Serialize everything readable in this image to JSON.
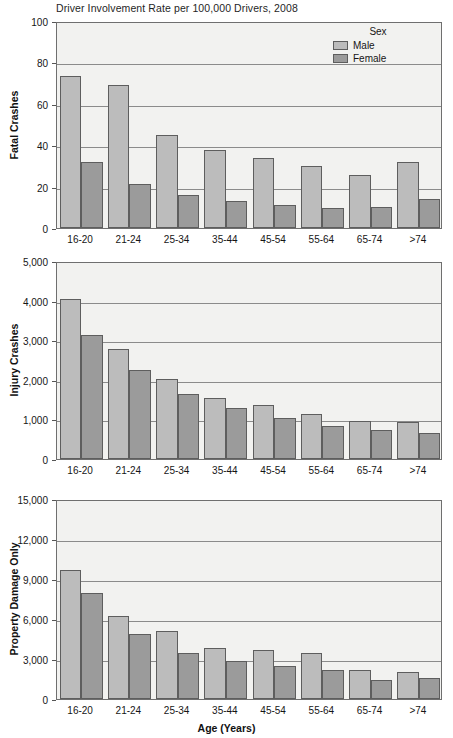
{
  "figure": {
    "title": "Driver Involvement Rate per 100,000 Drivers, 2008",
    "xaxis_title": "Age (Years)",
    "legend": {
      "title": "Sex",
      "entries": [
        {
          "label": "Male",
          "color": "#bcbcbc"
        },
        {
          "label": "Female",
          "color": "#9b9b9b"
        }
      ]
    },
    "categories": [
      "16-20",
      "21-24",
      "25-34",
      "35-44",
      "45-54",
      "55-64",
      "65-74",
      ">74"
    ]
  },
  "colors": {
    "male": "#bcbcbc",
    "female": "#9b9b9b",
    "plot_background": "#f2f2f0",
    "axis": "#6f6f6f",
    "gridline": "#8b8b8b"
  },
  "chart_data": [
    {
      "type": "bar",
      "title": "Driver Involvement Rate per 100,000 Drivers, 2008",
      "xlabel": "",
      "ylabel": "Fatal Crashes",
      "categories": [
        "16-20",
        "21-24",
        "25-34",
        "35-44",
        "45-54",
        "55-64",
        "65-74",
        ">74"
      ],
      "series": [
        {
          "name": "Male",
          "values": [
            73.5,
            69.0,
            45.0,
            37.8,
            34.0,
            30.0,
            25.5,
            31.7
          ]
        },
        {
          "name": "Female",
          "values": [
            31.8,
            21.2,
            15.8,
            13.2,
            11.3,
            9.8,
            10.3,
            14.0
          ]
        }
      ],
      "ylim": [
        0,
        100
      ],
      "yticks": [
        0,
        20,
        40,
        60,
        80,
        100
      ],
      "ytick_labels": [
        "0",
        "20",
        "40",
        "60",
        "80",
        "100"
      ],
      "grid": true,
      "legend_position": "top-right"
    },
    {
      "type": "bar",
      "title": "",
      "xlabel": "",
      "ylabel": "Injury Crashes",
      "categories": [
        "16-20",
        "21-24",
        "25-34",
        "35-44",
        "45-54",
        "55-64",
        "65-74",
        ">74"
      ],
      "series": [
        {
          "name": "Male",
          "values": [
            4030,
            2790,
            2030,
            1530,
            1370,
            1130,
            970,
            940
          ]
        },
        {
          "name": "Female",
          "values": [
            3140,
            2240,
            1630,
            1300,
            1040,
            840,
            740,
            650
          ]
        }
      ],
      "ylim": [
        0,
        5000
      ],
      "yticks": [
        0,
        1000,
        2000,
        3000,
        4000,
        5000
      ],
      "ytick_labels": [
        "0",
        "1,000",
        "2,000",
        "3,000",
        "4,000",
        "5,000"
      ],
      "grid": true,
      "legend_position": "none"
    },
    {
      "type": "bar",
      "title": "",
      "xlabel": "Age (Years)",
      "ylabel": "Property Damage Only",
      "categories": [
        "16-20",
        "21-24",
        "25-34",
        "35-44",
        "45-54",
        "55-64",
        "65-74",
        ">74"
      ],
      "series": [
        {
          "name": "Male",
          "values": [
            9700,
            6200,
            5100,
            3850,
            3650,
            3450,
            2200,
            2050
          ]
        },
        {
          "name": "Female",
          "values": [
            7950,
            4900,
            3450,
            2850,
            2500,
            2150,
            1450,
            1550
          ]
        }
      ],
      "ylim": [
        0,
        15000
      ],
      "yticks": [
        0,
        3000,
        6000,
        9000,
        12000,
        15000
      ],
      "ytick_labels": [
        "0",
        "3,000",
        "6,000",
        "9,000",
        "12,000",
        "15,000"
      ],
      "grid": true,
      "legend_position": "none"
    }
  ]
}
